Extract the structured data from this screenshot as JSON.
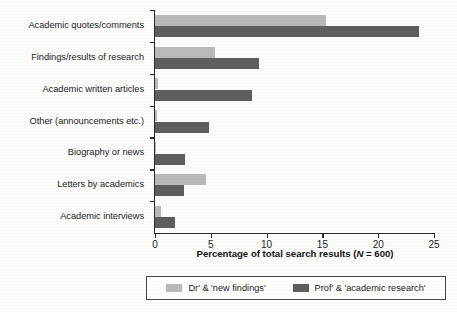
{
  "chart_data": {
    "type": "bar",
    "orientation": "horizontal",
    "title": "",
    "xlabel": "Percentage of total search results (N = 600)",
    "xlabel_parts": {
      "before": "Percentage of total search results (",
      "italic": "N",
      "after": " = 600)"
    },
    "ylabel": "",
    "xlim": [
      0,
      25
    ],
    "xticks": [
      0,
      5,
      10,
      15,
      20,
      25
    ],
    "xtick_labels": [
      "0",
      "5",
      "10",
      "15",
      "20",
      "25"
    ],
    "grid": false,
    "legend_position": "bottom",
    "categories": [
      "Academic quotes/comments",
      "Findings/results of research",
      "Academic written articles",
      "Other (announcements etc.)",
      "Biography or news",
      "Letters by academics",
      "Academic interviews"
    ],
    "series": [
      {
        "name": "Dr' & 'new findings'",
        "color": "#b9b9b9",
        "values": [
          15.3,
          5.4,
          0.3,
          0.2,
          0.1,
          4.6,
          0.5
        ]
      },
      {
        "name": "Prof' & 'academic research'",
        "color": "#5e5e5e",
        "values": [
          23.7,
          9.3,
          8.7,
          4.8,
          2.7,
          2.6,
          1.8
        ]
      }
    ]
  },
  "legend": {
    "entries": [
      {
        "label": "Dr' & 'new findings'",
        "swatch": "light"
      },
      {
        "label": "Prof' & 'academic research'",
        "swatch": "dark"
      }
    ]
  }
}
